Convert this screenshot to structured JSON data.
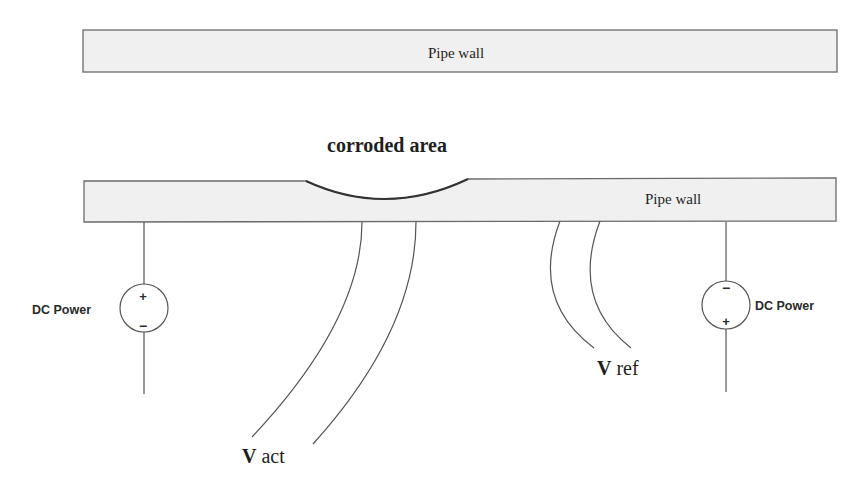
{
  "diagram": {
    "top_pipe": {
      "label": "Pipe wall"
    },
    "corroded_label": "corroded area",
    "bottom_pipe": {
      "label": "Pipe wall"
    },
    "left_source": {
      "label": "DC Power",
      "top_sign": "+",
      "bottom_sign": "−"
    },
    "right_source": {
      "label": "DC Power",
      "top_sign": "−",
      "bottom_sign": "+"
    },
    "v_act": {
      "bold": "V",
      "rest": " act"
    },
    "v_ref": {
      "bold": "V",
      "rest": " ref"
    },
    "colors": {
      "pipe_fill": "#f0f0f0",
      "stroke": "#555555",
      "text": "#1e1e1e"
    }
  }
}
